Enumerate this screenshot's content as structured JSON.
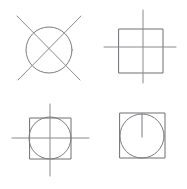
{
  "sheet": {
    "title": "Four Line Figures",
    "background_color": "#ffffff",
    "stroke_color": "#7b7b80",
    "width": 187,
    "height": 189,
    "style": "hand-drawn thin grey line art",
    "panel_count": 4,
    "layout": "2 x 2 grid of figures"
  },
  "figures": [
    {
      "id": "figure-top-left",
      "position": "top-left",
      "name": "circle-with-x",
      "description": "Circle crossed by two diagonal lines forming an X that extends past the circle",
      "elements": [
        {
          "shape": "circle",
          "name": "circle-outline",
          "cx": 49,
          "cy": 50,
          "r": 23
        },
        {
          "shape": "line",
          "name": "diagonal-down-right",
          "x1": 17,
          "y1": 16,
          "x2": 80,
          "y2": 80
        },
        {
          "shape": "line",
          "name": "diagonal-down-left",
          "x1": 81,
          "y1": 16,
          "x2": 18,
          "y2": 80
        }
      ]
    },
    {
      "id": "figure-top-right",
      "position": "top-right",
      "name": "square-with-cross",
      "description": "Square overlaid by a vertical and a horizontal line that extend past the square edges",
      "elements": [
        {
          "shape": "rect",
          "name": "square-outline",
          "x": 119,
          "y": 29,
          "width": 44,
          "height": 44
        },
        {
          "shape": "line",
          "name": "vertical-line",
          "x1": 143,
          "y1": 10,
          "x2": 143,
          "y2": 83
        },
        {
          "shape": "line",
          "name": "horizontal-line",
          "x1": 104,
          "y1": 47,
          "x2": 176,
          "y2": 47
        }
      ]
    },
    {
      "id": "figure-bottom-left",
      "position": "bottom-left",
      "name": "square-circle-with-cross",
      "description": "Square with an inscribed circle, crossed by a vertical and a horizontal line extending past both",
      "elements": [
        {
          "shape": "rect",
          "name": "square-outline",
          "x": 30,
          "y": 118,
          "width": 41,
          "height": 41
        },
        {
          "shape": "circle",
          "name": "inscribed-circle",
          "cx": 50,
          "cy": 138,
          "r": 21
        },
        {
          "shape": "line",
          "name": "vertical-line",
          "x1": 50,
          "y1": 104,
          "x2": 50,
          "y2": 176
        },
        {
          "shape": "line",
          "name": "horizontal-line",
          "x1": 12,
          "y1": 138,
          "x2": 89,
          "y2": 138
        }
      ]
    },
    {
      "id": "figure-bottom-right",
      "position": "bottom-right",
      "name": "square-circle-with-pointer",
      "description": "Square with an inscribed circle and a short vertical line from the circle top down to its centre, like a knob indicator",
      "elements": [
        {
          "shape": "rect",
          "name": "square-outline",
          "x": 120,
          "y": 113,
          "width": 45,
          "height": 45
        },
        {
          "shape": "circle",
          "name": "inscribed-circle",
          "cx": 142,
          "cy": 136,
          "r": 22
        },
        {
          "shape": "line",
          "name": "pointer-line",
          "x1": 142,
          "y1": 114,
          "x2": 142,
          "y2": 137
        }
      ]
    }
  ]
}
